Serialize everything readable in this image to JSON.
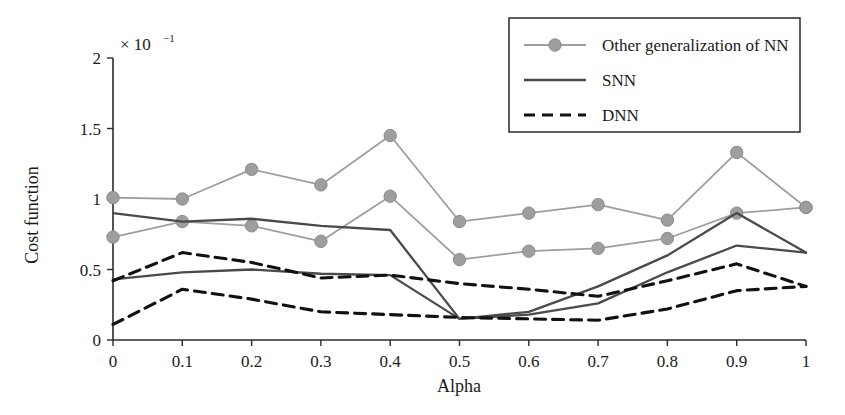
{
  "chart_data": {
    "type": "line",
    "title": "",
    "xlabel": "Alpha",
    "ylabel": "Cost function",
    "y_multiplier": "× 10",
    "y_multiplier_exponent": "−1",
    "x": [
      0,
      0.1,
      0.2,
      0.3,
      0.4,
      0.5,
      0.6,
      0.7,
      0.8,
      0.9,
      1
    ],
    "xticklabels": [
      "0",
      "0.1",
      "0.2",
      "0.3",
      "0.4",
      "0.5",
      "0.6",
      "0.7",
      "0.8",
      "0.9",
      "1"
    ],
    "yticklabels": [
      "0",
      "0.5",
      "1",
      "1.5",
      "2"
    ],
    "yticks": [
      0,
      0.5,
      1,
      1.5,
      2
    ],
    "xlim": [
      0,
      1
    ],
    "ylim": [
      0,
      2
    ],
    "grid": false,
    "legend_position": "top-right",
    "series": [
      {
        "name": "Other generalization of NN",
        "style": "marker-line",
        "color": "#9e9e9e",
        "marker": "circle",
        "values": [
          1.01,
          1.0,
          1.21,
          1.1,
          1.45,
          0.84,
          0.9,
          0.96,
          0.85,
          1.33,
          0.94
        ]
      },
      {
        "name": "Other generalization of NN",
        "style": "marker-line",
        "color": "#9e9e9e",
        "marker": "circle",
        "values": [
          0.73,
          0.84,
          0.81,
          0.7,
          1.02,
          0.57,
          0.63,
          0.65,
          0.72,
          0.9,
          0.94
        ]
      },
      {
        "name": "SNN",
        "style": "solid",
        "color": "#4a4a4a",
        "values": [
          0.9,
          0.84,
          0.86,
          0.81,
          0.78,
          0.15,
          0.2,
          0.38,
          0.6,
          0.9,
          0.62
        ]
      },
      {
        "name": "SNN",
        "style": "solid",
        "color": "#4a4a4a",
        "values": [
          0.43,
          0.48,
          0.5,
          0.47,
          0.46,
          0.15,
          0.18,
          0.26,
          0.48,
          0.67,
          0.62
        ]
      },
      {
        "name": "DNN",
        "style": "dashed",
        "color": "#111111",
        "values": [
          0.42,
          0.62,
          0.55,
          0.44,
          0.46,
          0.4,
          0.36,
          0.31,
          0.42,
          0.54,
          0.38
        ]
      },
      {
        "name": "DNN",
        "style": "dashed",
        "color": "#111111",
        "values": [
          0.11,
          0.36,
          0.29,
          0.2,
          0.18,
          0.16,
          0.15,
          0.14,
          0.22,
          0.35,
          0.38
        ]
      }
    ]
  },
  "legend": {
    "entries": [
      {
        "label": "Other generalization of NN",
        "style": "marker-line",
        "color": "#9e9e9e"
      },
      {
        "label": "SNN",
        "style": "solid",
        "color": "#4a4a4a"
      },
      {
        "label": "DNN",
        "style": "dashed",
        "color": "#111111"
      }
    ]
  },
  "axes": {
    "x_title": "Alpha",
    "y_title": "Cost function",
    "y_exponent_base": "× 10",
    "y_exponent_power": "−1"
  }
}
